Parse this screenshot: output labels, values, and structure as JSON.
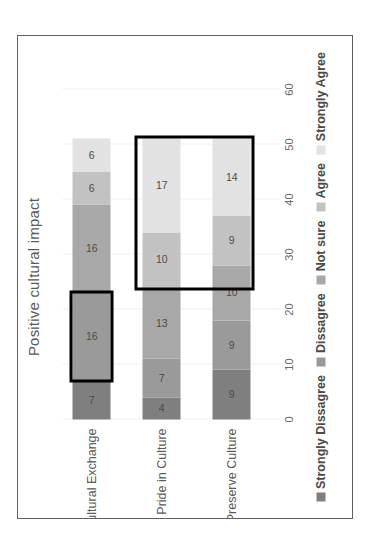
{
  "chart_data": {
    "type": "bar",
    "orientation": "horizontal-stacked",
    "title": "Positive cultural impact",
    "xlabel": "",
    "ylabel": "",
    "categories": [
      "Cultural Exchange",
      "Pride in Culture",
      "Preserve Culture"
    ],
    "series": [
      {
        "name": "Strongly Dissagree",
        "values": [
          7,
          4,
          9
        ],
        "color": "#7f7f7f"
      },
      {
        "name": "Dissagree",
        "values": [
          16,
          7,
          9
        ],
        "color": "#9a9a9a"
      },
      {
        "name": "Not sure",
        "values": [
          16,
          13,
          10
        ],
        "color": "#a8a8a8"
      },
      {
        "name": "Agree",
        "values": [
          6,
          10,
          9
        ],
        "color": "#c2c2c2"
      },
      {
        "name": "Strongly Agree",
        "values": [
          6,
          17,
          14
        ],
        "color": "#e2e2e2"
      }
    ],
    "xticks": [
      "0",
      "10",
      "20",
      "30",
      "40",
      "50",
      "60"
    ],
    "xlim": [
      0,
      60
    ],
    "grid": true,
    "legend_position": "bottom",
    "stack_totals": [
      51,
      51,
      51
    ],
    "annotations": [
      {
        "label": "highlight-box-cultural-exchange-dissagree",
        "category": "Cultural Exchange",
        "series": [
          "Dissagree"
        ]
      },
      {
        "label": "highlight-box-agree-strongly-agree",
        "category": "Pride in Culture, Preserve Culture",
        "series": [
          "Agree",
          "Strongly Agree"
        ]
      }
    ]
  },
  "labels": {
    "cat0": "Cultural Exchange",
    "cat1": "Pride in Culture",
    "cat2": "Preserve Culture"
  },
  "legend": {
    "i0": "Strongly Dissagree",
    "i1": "Dissagree",
    "i2": "Not sure",
    "i3": "Agree",
    "i4": "Strongly Agree"
  },
  "ticks": {
    "t0": "0",
    "t1": "10",
    "t2": "20",
    "t3": "30",
    "t4": "40",
    "t5": "50",
    "t6": "60"
  },
  "values": {
    "cultural_exchange": {
      "v0": "7",
      "v1": "16",
      "v2": "16",
      "v3": "6",
      "v4": "6"
    },
    "pride_in_culture": {
      "v0": "4",
      "v1": "7",
      "v2": "13",
      "v3": "10",
      "v4": "17"
    },
    "preserve_culture": {
      "v0": "9",
      "v1": "9",
      "v2": "10",
      "v3": "9",
      "v4": "14"
    }
  },
  "colors": {
    "strongly_dissagree": "#7f7f7f",
    "dissagree": "#9a9a9a",
    "not_sure": "#a8a8a8",
    "agree": "#c2c2c2",
    "strongly_agree": "#e2e2e2",
    "annotation": "#000000",
    "grid": "#eef1f5",
    "frame": "#5f5f5f"
  }
}
